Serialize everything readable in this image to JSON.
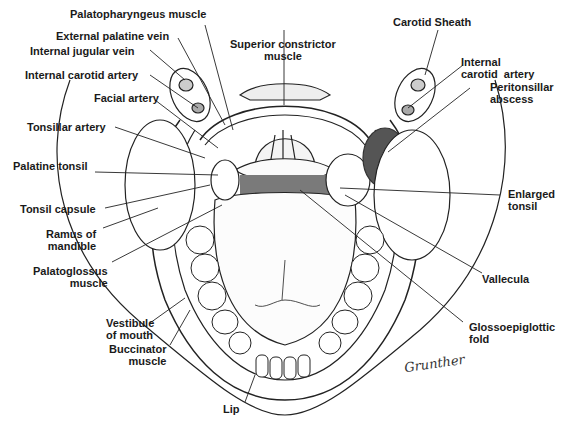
{
  "figure": {
    "signature": "Grunther",
    "abscess_color": "#555555"
  },
  "labels": {
    "palatopharyngeus_muscle": "Palatopharyngeus muscle",
    "external_palatine_vein": "External palatine vein",
    "internal_jugular_vein": "Internal jugular vein",
    "internal_carotid_artery_left": "Internal carotid artery",
    "facial_artery": "Facial artery",
    "tonsillar_artery": "Tonsillar artery",
    "palatine_tonsil": "Palatine tonsil",
    "tonsil_capsule": "Tonsil capsule",
    "ramus_of_mandible": "Ramus of\nmandible",
    "palatoglossus_muscle": "Palatoglossus\nmuscle",
    "vestibule_of_mouth": "Vestibule\nof mouth",
    "buccinator_muscle": "Buccinator\nmuscle",
    "superior_constrictor_muscle": "Superior constrictor\nmuscle",
    "carotid_sheath": "Carotid Sheath",
    "internal_carotid_artery_right": "Internal\ncarotid  artery",
    "peritonsillar_abscess": "Peritonsillar\nabscess",
    "enlarged_tonsil": "Enlarged\ntonsil",
    "vallecula": "Vallecula",
    "glossoepiglottic_fold": "Glossoepiglottic\nfold",
    "lip": "Lip"
  }
}
